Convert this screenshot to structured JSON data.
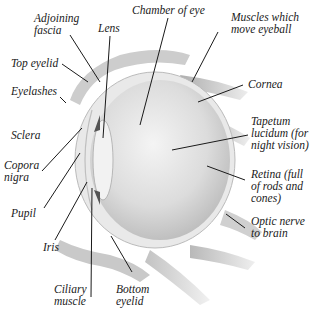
{
  "diagram": {
    "colors": {
      "ink": "#1a1a1a",
      "eyeball": "#d8d8d8",
      "muscle": "#b5b5b5"
    },
    "labels": [
      {
        "id": "adjoining-fascia",
        "text": "Adjoining\nfascia",
        "x": 34,
        "y": 12
      },
      {
        "id": "lens",
        "text": "Lens",
        "x": 98,
        "y": 22
      },
      {
        "id": "chamber-of-eye",
        "text": "Chamber of eye",
        "x": 132,
        "y": 4
      },
      {
        "id": "muscles-which-move-eyeball",
        "text": "Muscles which\nmove eyeball",
        "x": 231,
        "y": 11
      },
      {
        "id": "top-eyelid",
        "text": "Top eyelid",
        "x": 11,
        "y": 57
      },
      {
        "id": "eyelashes",
        "text": "Eyelashes",
        "x": 11,
        "y": 85
      },
      {
        "id": "cornea",
        "text": "Cornea",
        "x": 248,
        "y": 78
      },
      {
        "id": "sclera",
        "text": "Sclera",
        "x": 11,
        "y": 129
      },
      {
        "id": "tapetum-lucidum",
        "text": "Tapetum\nlucidum (for\nnight vision)",
        "x": 251,
        "y": 115
      },
      {
        "id": "copora-nigra",
        "text": "Copora\nnigra",
        "x": 4,
        "y": 159
      },
      {
        "id": "retina",
        "text": "Retina (full\nof rods and\ncones)",
        "x": 251,
        "y": 168
      },
      {
        "id": "pupil",
        "text": "Pupil",
        "x": 11,
        "y": 207
      },
      {
        "id": "optic-nerve",
        "text": "Optic nerve\nto brain",
        "x": 251,
        "y": 215
      },
      {
        "id": "iris",
        "text": "Iris",
        "x": 43,
        "y": 241
      },
      {
        "id": "ciliary-muscle",
        "text": "Ciliary\nmuscle",
        "x": 54,
        "y": 283
      },
      {
        "id": "bottom-eyelid",
        "text": "Bottom\neyelid",
        "x": 116,
        "y": 283
      }
    ]
  }
}
